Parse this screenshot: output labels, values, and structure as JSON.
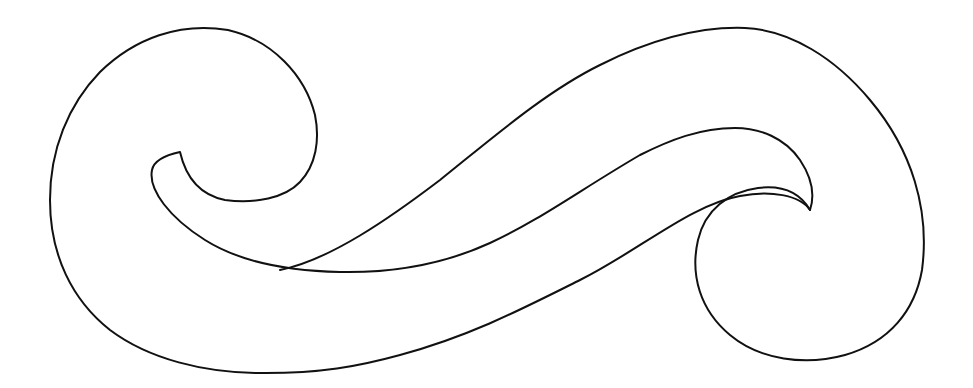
{
  "drawing": {
    "title": "S-shaped scroll wave outline",
    "background": "#ffffff",
    "stroke_color": "#111111",
    "stroke_width": 2,
    "fill": "none"
  }
}
